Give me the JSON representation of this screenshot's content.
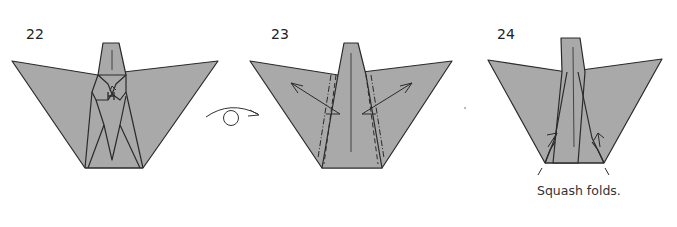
{
  "steps": [
    {
      "number": "22",
      "caption": ""
    },
    {
      "number": "23",
      "caption": ""
    },
    {
      "number": "24",
      "caption": "Squash folds."
    }
  ],
  "transition": {
    "icon": "turn-over-icon"
  },
  "colors": {
    "paper": "#a9a9a9",
    "line": "#2a2a2a",
    "background": "#ffffff"
  }
}
